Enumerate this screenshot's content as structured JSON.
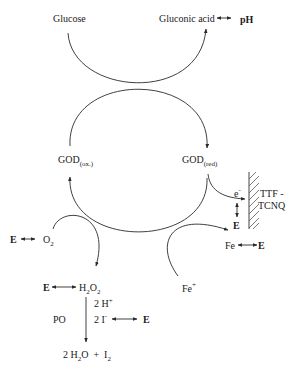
{
  "diagram": {
    "type": "enzymatic-reaction-scheme",
    "substrate": "Glucose",
    "product": "Gluconic acid",
    "product_detection": "pH",
    "enzyme_oxidized": {
      "main": "GOD",
      "sub": "(ox.)"
    },
    "enzyme_reduced": {
      "main": "GOD",
      "sub": "(red)"
    },
    "electron": {
      "main": "e",
      "sup": "-"
    },
    "electrode": {
      "line1": "TTF -",
      "line2": "TCNQ"
    },
    "electrode_detection": "E",
    "oxygen": {
      "main": "O",
      "sub": "2"
    },
    "oxygen_detection": "E",
    "ferricinium": {
      "main": "Fe",
      "sup": "+"
    },
    "ferrocene": "Fe",
    "ferrocene_detection": "E",
    "peroxide": {
      "p1": "H",
      "s1": "2",
      "p2": "O",
      "s2": "2"
    },
    "peroxide_detection": "E",
    "protons": {
      "main": "2 H",
      "sup": "+"
    },
    "iodide": {
      "main": "2 I",
      "sup": "-"
    },
    "iodide_detection": "E",
    "peroxidase": "PO",
    "final_products": {
      "p1": "2 H",
      "s1": "2",
      "p2": "O  +  I",
      "s2": "2"
    }
  }
}
